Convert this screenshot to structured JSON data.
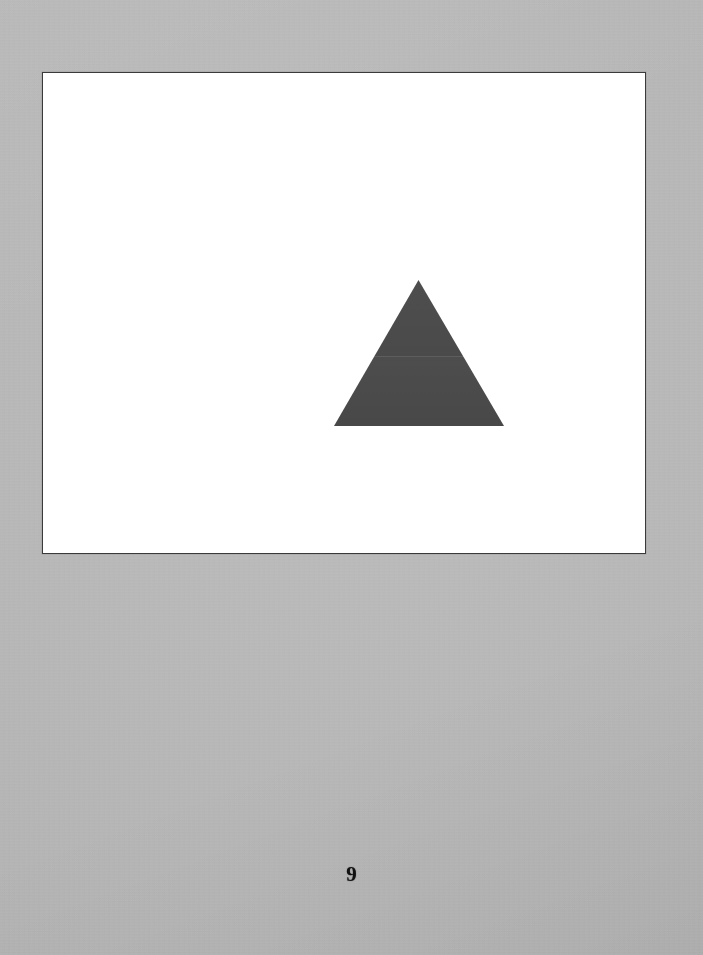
{
  "document": {
    "kind": "scanned-book-page",
    "background_color": "#b6b6b6",
    "page_width": 703,
    "page_height": 955
  },
  "plate": {
    "name": "illustration-plate",
    "background_color": "#ffffff",
    "border_color": "#3a3a3a",
    "x": 42,
    "y": 72,
    "width": 604,
    "height": 482
  },
  "figure": {
    "shape": "triangle",
    "orientation": "apex-up",
    "fill_color": "#4a4a4a",
    "apex_x": 417,
    "apex_y": 279,
    "base_left_x": 333,
    "base_right_x": 503,
    "base_y": 425,
    "width": 170,
    "height": 146
  },
  "folio": {
    "page_number": "9"
  }
}
